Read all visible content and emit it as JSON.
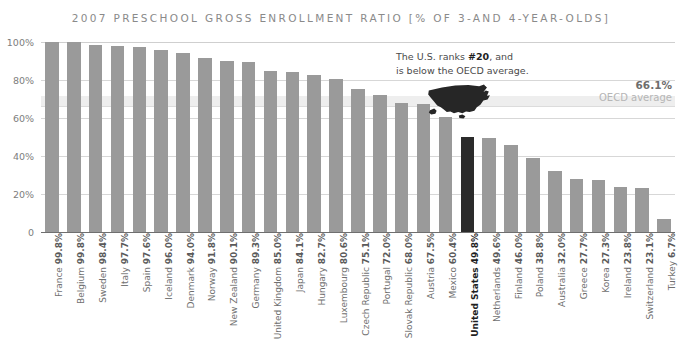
{
  "chart_data": {
    "type": "bar",
    "title": "2007 PRESCHOOL GROSS ENROLLMENT RATIO [% OF 3-AND 4-YEAR-OLDS]",
    "xlabel": "",
    "ylabel": "",
    "ylim": [
      0,
      100
    ],
    "yticks": [
      "0",
      "20%",
      "40%",
      "60%",
      "80%",
      "100%"
    ],
    "ytick_values": [
      0,
      20,
      40,
      60,
      80,
      100
    ],
    "grid": true,
    "legend": "none",
    "categories": [
      "France",
      "Belgium",
      "Sweden",
      "Italy",
      "Spain",
      "Iceland",
      "Denmark",
      "Norway",
      "New Zealand",
      "Germany",
      "United Kingdom",
      "Japan",
      "Hungary",
      "Luxembourg",
      "Czech Republic",
      "Portugal",
      "Slovak Republic",
      "Austria",
      "Mexico",
      "United States",
      "Netherlands",
      "Finland",
      "Poland",
      "Australia",
      "Greece",
      "Korea",
      "Ireland",
      "Switzerland",
      "Turkey"
    ],
    "values": [
      99.8,
      99.8,
      98.4,
      97.7,
      97.6,
      96.0,
      94.0,
      91.8,
      90.1,
      89.3,
      85.0,
      84.1,
      82.7,
      80.6,
      75.1,
      72.0,
      68.0,
      67.5,
      60.4,
      49.8,
      49.6,
      46.0,
      38.8,
      32.0,
      27.7,
      27.3,
      23.8,
      23.1,
      6.7
    ],
    "value_labels": [
      "99.8%",
      "99.8%",
      "98.4%",
      "97.7%",
      "97.6%",
      "96.0%",
      "94.0%",
      "91.8%",
      "90.1%",
      "89.3%",
      "85.0%",
      "84.1%",
      "82.7%",
      "80.6%",
      "75.1%",
      "72.0%",
      "68.0%",
      "67.5%",
      "60.4%",
      "49.8%",
      "49.6%",
      "46.0%",
      "38.8%",
      "32.0%",
      "27.7%",
      "27.3%",
      "23.8%",
      "23.1%",
      "6.7%"
    ],
    "highlight_index": 19,
    "reference_line": {
      "value": 66.1,
      "value_label": "66.1%",
      "caption": "OECD average"
    },
    "annotations": [
      {
        "line1_pre": "The U.S. ranks ",
        "line1_bold": "#20",
        "line1_post": ", and",
        "line2": "is below the OECD average."
      }
    ],
    "colors": {
      "bar": "#9a9a9a",
      "bar_highlight": "#2b2b2b",
      "band": "#eeeeee",
      "grid": "#d7d7d7",
      "title_text": "#8a8a8a",
      "axis_text": "#7d7d7d",
      "label_text": "#6f6f6f"
    }
  }
}
